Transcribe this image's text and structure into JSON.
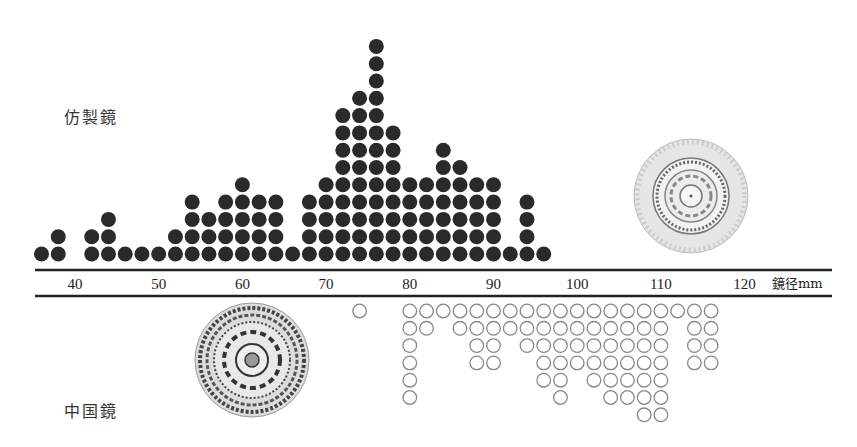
{
  "chart_data": {
    "type": "scatter",
    "subtype": "dot-histogram",
    "title": "",
    "xlabel": "鏡径mm",
    "x_ticks": [
      40,
      50,
      60,
      70,
      80,
      90,
      100,
      110,
      120
    ],
    "xlim": [
      35,
      125
    ],
    "bin_width_mm": 2,
    "series": [
      {
        "name": "仿製鏡",
        "marker": "filled",
        "direction": "up",
        "color": "#2a2a2a",
        "bins": [
          {
            "x": 36,
            "count": 1
          },
          {
            "x": 38,
            "count": 2
          },
          {
            "x": 42,
            "count": 2
          },
          {
            "x": 44,
            "count": 3
          },
          {
            "x": 46,
            "count": 1
          },
          {
            "x": 48,
            "count": 1
          },
          {
            "x": 50,
            "count": 1
          },
          {
            "x": 52,
            "count": 2
          },
          {
            "x": 54,
            "count": 4
          },
          {
            "x": 56,
            "count": 3
          },
          {
            "x": 58,
            "count": 4
          },
          {
            "x": 60,
            "count": 5
          },
          {
            "x": 62,
            "count": 4
          },
          {
            "x": 64,
            "count": 4
          },
          {
            "x": 66,
            "count": 1
          },
          {
            "x": 68,
            "count": 4
          },
          {
            "x": 70,
            "count": 5
          },
          {
            "x": 72,
            "count": 9
          },
          {
            "x": 74,
            "count": 10
          },
          {
            "x": 76,
            "count": 13
          },
          {
            "x": 78,
            "count": 8
          },
          {
            "x": 80,
            "count": 5
          },
          {
            "x": 82,
            "count": 5
          },
          {
            "x": 84,
            "count": 7
          },
          {
            "x": 86,
            "count": 6
          },
          {
            "x": 88,
            "count": 5
          },
          {
            "x": 90,
            "count": 5
          },
          {
            "x": 92,
            "count": 1
          },
          {
            "x": 94,
            "count": 4
          },
          {
            "x": 96,
            "count": 1
          }
        ]
      },
      {
        "name": "中国鏡",
        "marker": "hollow",
        "direction": "down",
        "color": "#888888",
        "bins": [
          {
            "x": 74,
            "count": 1
          },
          {
            "x": 80,
            "count": 6
          },
          {
            "x": 82,
            "count": 2
          },
          {
            "x": 84,
            "count": 1
          },
          {
            "x": 86,
            "count": 2
          },
          {
            "x": 88,
            "count": 4
          },
          {
            "x": 90,
            "count": 4
          },
          {
            "x": 92,
            "count": 2
          },
          {
            "x": 94,
            "count": 3
          },
          {
            "x": 96,
            "count": 5
          },
          {
            "x": 98,
            "count": 6
          },
          {
            "x": 100,
            "count": 4
          },
          {
            "x": 102,
            "count": 5
          },
          {
            "x": 104,
            "count": 6
          },
          {
            "x": 106,
            "count": 6
          },
          {
            "x": 108,
            "count": 7
          },
          {
            "x": 110,
            "count": 7
          },
          {
            "x": 112,
            "count": 1
          },
          {
            "x": 114,
            "count": 4
          },
          {
            "x": 116,
            "count": 4
          }
        ]
      }
    ],
    "annotations": [
      {
        "text": "仿製鏡",
        "type": "series-label",
        "placement": "upper-left"
      },
      {
        "text": "中国鏡",
        "type": "series-label",
        "placement": "lower-left"
      },
      {
        "type": "mirror-image",
        "depicts": "仿製鏡 rubbing",
        "placement": "upper-right"
      },
      {
        "type": "mirror-image",
        "depicts": "中国鏡 rubbing",
        "placement": "lower-left"
      }
    ]
  }
}
